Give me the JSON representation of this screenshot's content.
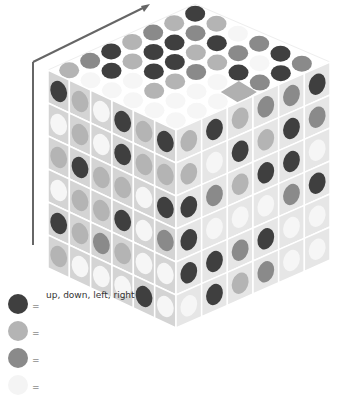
{
  "colors": {
    "dark": "#3f3f3f",
    "light": "#b4b4b4",
    "mid": "#8a8a8a",
    "white": "#f6f6f6",
    "face_left": "#d4d4d4",
    "face_right": "#e6e6e6",
    "top_bg": "#ffffff",
    "arrow": "#666666",
    "target_diamond": "#b0b0b0"
  },
  "arrow": {
    "direction": "up-right along cube edge"
  },
  "top_grid": [
    [
      "light",
      "white",
      "white",
      "white",
      "white",
      "white"
    ],
    [
      "mid",
      "dark",
      "white",
      "light",
      "white",
      "white"
    ],
    [
      "dark",
      "light",
      "dark",
      "light",
      "white",
      "white"
    ],
    [
      "light",
      "dark",
      "dark",
      "mid",
      "white",
      "target"
    ],
    [
      "mid",
      "dark",
      "light",
      "light",
      "dark",
      "mid"
    ],
    [
      "light",
      "mid",
      "dark",
      "mid",
      "white",
      "dark"
    ],
    [
      "dark",
      "light",
      "white",
      "mid",
      "dark",
      "mid"
    ]
  ],
  "left_face": [
    [
      "dark",
      "light",
      "white",
      "dark",
      "light",
      "dark"
    ],
    [
      "white",
      "light",
      "white",
      "dark",
      "light",
      "light"
    ],
    [
      "light",
      "dark",
      "light",
      "light",
      "white",
      "dark"
    ],
    [
      "white",
      "light",
      "light",
      "dark",
      "white",
      "mid"
    ],
    [
      "dark",
      "light",
      "mid",
      "light",
      "white",
      "white"
    ],
    [
      "light",
      "white",
      "white",
      "white",
      "dark",
      "white"
    ]
  ],
  "right_face": [
    [
      "light",
      "dark",
      "light",
      "mid",
      "mid",
      "dark"
    ],
    [
      "light",
      "white",
      "dark",
      "light",
      "dark",
      "mid"
    ],
    [
      "dark",
      "mid",
      "light",
      "dark",
      "dark",
      "white"
    ],
    [
      "dark",
      "white",
      "white",
      "white",
      "mid",
      "dark"
    ],
    [
      "dark",
      "dark",
      "mid",
      "dark",
      "white",
      "white"
    ],
    [
      "white",
      "dark",
      "light",
      "mid",
      "white",
      "white"
    ]
  ],
  "legend": [
    {
      "color": "dark",
      "eq": "=",
      "label": "up, down, left, right"
    },
    {
      "color": "light",
      "eq": "=",
      "label": ""
    },
    {
      "color": "mid",
      "eq": "=",
      "label": ""
    },
    {
      "color": "white",
      "eq": "=",
      "label": ""
    }
  ]
}
